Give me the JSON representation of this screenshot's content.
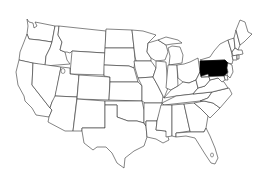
{
  "map": {
    "title": "United States map with Pennsylvania highlighted",
    "region": "Contiguous United States",
    "highlighted_state": "Pennsylvania",
    "highlight_color": "#000000",
    "fill_color": "#ffffff",
    "border_color": "#333333",
    "background_color": "#ffffff"
  },
  "states": [
    {
      "name": "Washington"
    },
    {
      "name": "Oregon"
    },
    {
      "name": "California"
    },
    {
      "name": "Idaho"
    },
    {
      "name": "Nevada"
    },
    {
      "name": "Montana"
    },
    {
      "name": "Wyoming"
    },
    {
      "name": "Utah"
    },
    {
      "name": "Arizona"
    },
    {
      "name": "Colorado"
    },
    {
      "name": "New Mexico"
    },
    {
      "name": "North Dakota"
    },
    {
      "name": "South Dakota"
    },
    {
      "name": "Nebraska"
    },
    {
      "name": "Kansas"
    },
    {
      "name": "Oklahoma"
    },
    {
      "name": "Texas"
    },
    {
      "name": "Minnesota"
    },
    {
      "name": "Iowa"
    },
    {
      "name": "Missouri"
    },
    {
      "name": "Arkansas"
    },
    {
      "name": "Louisiana"
    },
    {
      "name": "Wisconsin"
    },
    {
      "name": "Illinois"
    },
    {
      "name": "Michigan"
    },
    {
      "name": "Indiana"
    },
    {
      "name": "Ohio"
    },
    {
      "name": "Kentucky"
    },
    {
      "name": "Tennessee"
    },
    {
      "name": "Mississippi"
    },
    {
      "name": "Alabama"
    },
    {
      "name": "Georgia"
    },
    {
      "name": "Florida"
    },
    {
      "name": "South Carolina"
    },
    {
      "name": "North Carolina"
    },
    {
      "name": "Virginia"
    },
    {
      "name": "West Virginia"
    },
    {
      "name": "Pennsylvania",
      "highlighted": true
    },
    {
      "name": "New York"
    },
    {
      "name": "Vermont"
    },
    {
      "name": "New Hampshire"
    },
    {
      "name": "Maine"
    },
    {
      "name": "Massachusetts"
    },
    {
      "name": "Connecticut"
    },
    {
      "name": "Rhode Island"
    },
    {
      "name": "New Jersey"
    },
    {
      "name": "Delaware"
    },
    {
      "name": "Maryland"
    }
  ]
}
